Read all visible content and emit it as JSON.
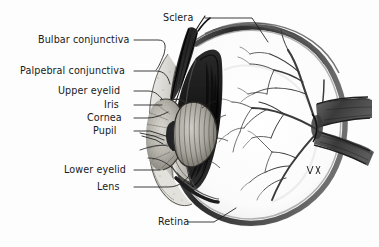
{
  "figure": {
    "style": "grayscale pen-and-ink anatomical illustration",
    "background_color": "#fdfdfd",
    "ink_color": "#1a1a1a",
    "signature": "artist monogram, lower right near optic nerve"
  },
  "labels": [
    {
      "id": "sclera",
      "text": "Sclera",
      "x": 163,
      "y": 18,
      "anchor_end": 130
    },
    {
      "id": "bulbar-conjunctiva",
      "text": "Bulbar conjunctiva",
      "x": 38,
      "y": 40,
      "anchor_end": 130
    },
    {
      "id": "palpebral-conjunctiva",
      "text": "Palpebral conjunctiva",
      "x": 20,
      "y": 71,
      "anchor_end": 130
    },
    {
      "id": "upper-eyelid",
      "text": "Upper eyelid",
      "x": 58,
      "y": 91,
      "anchor_end": 130
    },
    {
      "id": "iris",
      "text": "Iris",
      "x": 104,
      "y": 105,
      "anchor_end": 130
    },
    {
      "id": "cornea",
      "text": "Cornea",
      "x": 87,
      "y": 118,
      "anchor_end": 130
    },
    {
      "id": "pupil",
      "text": "Pupil",
      "x": 93,
      "y": 131,
      "anchor_end": 130
    },
    {
      "id": "lower-eyelid",
      "text": "Lower eyelid",
      "x": 64,
      "y": 170,
      "anchor_end": 130
    },
    {
      "id": "lens",
      "text": "Lens",
      "x": 97,
      "y": 187,
      "anchor_end": 130
    },
    {
      "id": "retina",
      "text": "Retina",
      "x": 158,
      "y": 222,
      "anchor_end": 130
    }
  ],
  "structures": [
    "sclera",
    "cornea",
    "iris",
    "pupil",
    "lens",
    "retina",
    "choroid",
    "vitreous chamber",
    "anterior chamber",
    "ciliary body",
    "upper eyelid",
    "lower eyelid",
    "bulbar conjunctiva",
    "palpebral conjunctiva",
    "optic nerve",
    "retinal blood vessels"
  ]
}
